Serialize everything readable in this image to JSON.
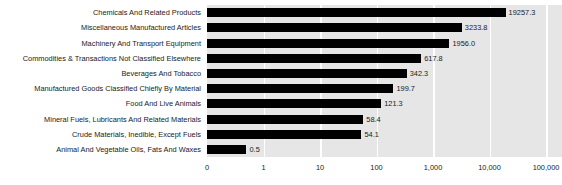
{
  "chart": {
    "type": "bar",
    "orientation": "horizontal"
  },
  "chart_data": {
    "type": "bar",
    "title": "",
    "subtitle": "",
    "xlabel": "",
    "ylabel": "",
    "orientation": "horizontal",
    "xscale": "log",
    "grid": true,
    "legend": false,
    "bar_color": "#000000",
    "plot_background": "#e6e6e6",
    "gridline_color": "#ffffff",
    "page_background": "#ffffff",
    "xticks": [
      "0",
      "1",
      "10",
      "100",
      "1,000",
      "10,000",
      "100,000"
    ],
    "xtick_values": [
      0,
      1,
      10,
      100,
      1000,
      10000,
      100000
    ],
    "xlim": [
      0,
      100000
    ],
    "categories": [
      "Chemicals And Related Products",
      "Miscellaneous Manufactured Articles",
      "Machinery And Transport Equipment",
      "Commodities & Transactions Not Classified Elsewhere",
      "Beverages And Tobacco",
      "Manufactured Goods Classified Chiefly By Material",
      "Food And Live Animals",
      "Mineral Fuels, Lubricants And Related Materials",
      "Crude Materials, Inedible, Except Fuels",
      "Animal And Vegetable Oils, Fats And Waxes"
    ],
    "values": [
      19257.3,
      3233.8,
      1956.0,
      617.8,
      342.3,
      199.7,
      121.3,
      58.4,
      54.1,
      0.5
    ],
    "value_labels": [
      "19257.3",
      "3233.8",
      "1956.0",
      "617.8",
      "342.3",
      "199.7",
      "121.3",
      "58.4",
      "54.1",
      "0.5"
    ]
  }
}
